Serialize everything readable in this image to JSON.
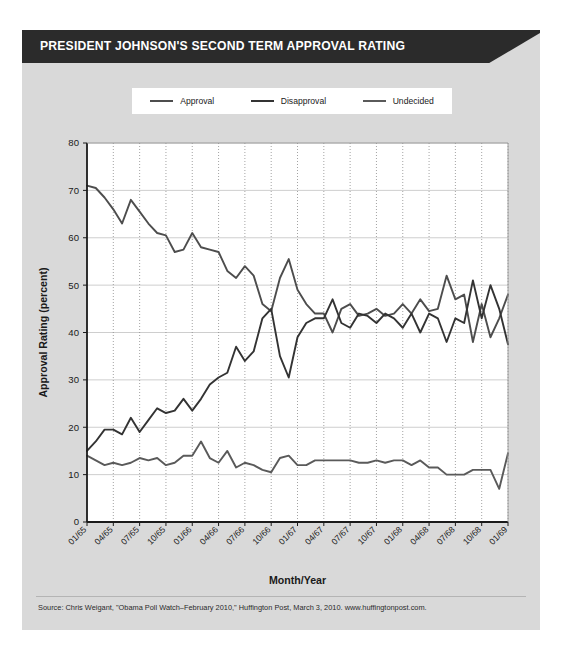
{
  "figure": {
    "title": "PRESIDENT JOHNSON'S SECOND TERM APPROVAL RATING",
    "source": "Source: Chris Weigant, \"Obama Poll Watch–February 2010,\" Huffington Post, March 3, 2010. www.huffingtonpost.com.",
    "colors": {
      "header_bar": "#2b2b2b",
      "panel_background": "#d9d9d9",
      "plot_background": "#ffffff",
      "approval_line": "#4d4d4d",
      "disapproval_line": "#333333",
      "undecided_line": "#5a5a5a",
      "gridline": "#c8c8c8",
      "axis": "#1a1a1a"
    }
  },
  "chart_data": {
    "type": "line",
    "title": "PRESIDENT JOHNSON'S SECOND TERM APPROVAL RATING",
    "xlabel": "Month/Year",
    "ylabel": "Approval Rating (percent)",
    "ylim": [
      0,
      80
    ],
    "ytick_values": [
      0,
      10,
      20,
      30,
      40,
      50,
      60,
      70,
      80
    ],
    "ytick_labels": [
      "0",
      "10",
      "20",
      "30",
      "40",
      "50",
      "60",
      "70",
      "80"
    ],
    "xtick_labels": [
      "01/65",
      "04/65",
      "07/65",
      "10/65",
      "01/66",
      "04/66",
      "07/66",
      "10/66",
      "01/67",
      "04/67",
      "07/67",
      "10/67",
      "01/68",
      "04/68",
      "07/68",
      "10/68",
      "01/69"
    ],
    "xtick_indices": [
      0,
      3,
      6,
      9,
      12,
      15,
      18,
      21,
      24,
      27,
      30,
      33,
      36,
      39,
      42,
      45,
      48
    ],
    "x_count": 49,
    "grid": {
      "vertical": "dotted",
      "horizontal": "solid",
      "on": true
    },
    "legend": {
      "position": "above-plot",
      "entries": [
        "Approval",
        "Disapproval",
        "Undecided"
      ]
    },
    "series": [
      {
        "name": "Approval",
        "values": [
          71,
          70.5,
          68.5,
          66,
          63,
          68,
          65.5,
          63,
          61,
          60.5,
          57,
          57.5,
          61,
          58,
          57.5,
          57,
          53,
          51.5,
          54,
          52,
          46,
          44.5,
          51.5,
          55.5,
          49,
          46,
          44,
          44,
          40,
          45,
          46,
          43.5,
          44,
          45,
          43.5,
          44,
          46,
          44,
          47,
          44.5,
          45,
          52,
          47,
          48,
          38,
          46,
          39,
          43,
          48
        ]
      },
      {
        "name": "Disapproval",
        "values": [
          15,
          17,
          19.5,
          19.5,
          18.5,
          22,
          19,
          21.5,
          24,
          23,
          23.5,
          26,
          23.5,
          26,
          29,
          30.5,
          31.5,
          37,
          34,
          36,
          43,
          45,
          35,
          30.5,
          39,
          42,
          43,
          43,
          47,
          42,
          41,
          44,
          43.5,
          42,
          44,
          43,
          41,
          44,
          40,
          44,
          43,
          38,
          43,
          42,
          51,
          43,
          50,
          45,
          37.5
        ]
      },
      {
        "name": "Undecided",
        "values": [
          14,
          13,
          12,
          12.5,
          12,
          12.5,
          13.5,
          13,
          13.5,
          12,
          12.5,
          14,
          14,
          17,
          13.5,
          12.5,
          15,
          11.5,
          12.5,
          12,
          11,
          10.5,
          13.5,
          14,
          12,
          12,
          13,
          13,
          13,
          13,
          13,
          12.5,
          12.5,
          13,
          12.5,
          13,
          13,
          12,
          13,
          11.5,
          11.5,
          10,
          10,
          10,
          11,
          11,
          11,
          7,
          14.5
        ]
      }
    ]
  },
  "legend_items": [
    {
      "label": "Approval",
      "color": "#4d4d4d"
    },
    {
      "label": "Disapproval",
      "color": "#333333"
    },
    {
      "label": "Undecided",
      "color": "#5a5a5a"
    }
  ]
}
